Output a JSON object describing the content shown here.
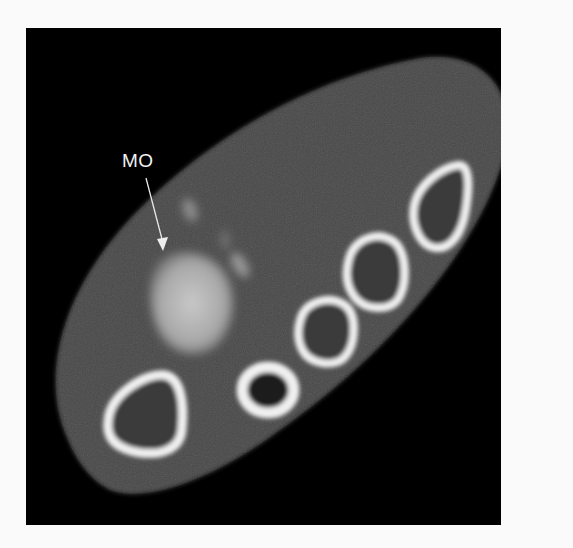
{
  "figure": {
    "type": "CT axial cross-section",
    "annotations": [
      {
        "id": "mo",
        "text": "MO"
      }
    ],
    "structures": {
      "bones": [
        {
          "name": "bone-1",
          "cx": 140,
          "cy": 415
        },
        {
          "name": "bone-2",
          "cx": 268,
          "cy": 393
        },
        {
          "name": "bone-3",
          "cx": 322,
          "cy": 333
        },
        {
          "name": "bone-4",
          "cx": 372,
          "cy": 277
        },
        {
          "name": "bone-5",
          "cx": 440,
          "cy": 208
        }
      ],
      "lesion": {
        "name": "MO-lesion",
        "cx": 190,
        "cy": 295
      }
    },
    "colors": {
      "background": "#000000",
      "soft_tissue": "#4a4a4a",
      "cortical_bone": "#f0f0f0",
      "lesion": "#b5b5b5",
      "page": "#fafafa"
    }
  }
}
